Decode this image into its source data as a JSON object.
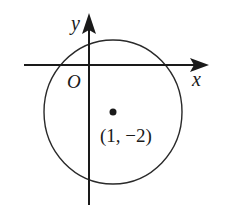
{
  "diagram": {
    "type": "coordinate-plane-circle",
    "axes": {
      "x_label": "x",
      "y_label": "y",
      "origin_label": "O"
    },
    "circle": {
      "center_label": "(1, −2)",
      "center": [
        1,
        -2
      ]
    },
    "colors": {
      "stroke": "#1a1a1a",
      "background": "#ffffff"
    }
  }
}
